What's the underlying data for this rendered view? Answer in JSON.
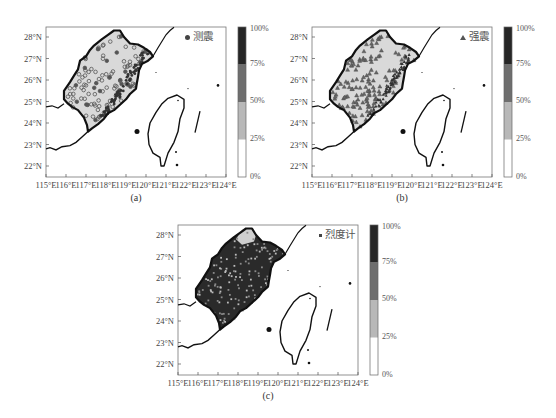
{
  "figure": {
    "caption_partial": "",
    "colorbar": {
      "ticks": [
        "0%",
        "25%",
        "50%",
        "75%",
        "100%"
      ],
      "bins": [
        {
          "range": "0%-25%",
          "color": "#ffffff"
        },
        {
          "range": "25%-50%",
          "color": "#b8b8b8"
        },
        {
          "range": "50%-75%",
          "color": "#6e6e6e"
        },
        {
          "range": "75%-100%",
          "color": "#262626"
        }
      ]
    },
    "x_ticks": [
      "115°E",
      "116°E",
      "117°E",
      "118°E",
      "119°E",
      "120°E",
      "121°E",
      "122°E",
      "123°E",
      "124°E"
    ],
    "y_ticks": [
      "22°N",
      "23°N",
      "24°N",
      "25°N",
      "26°N",
      "27°N",
      "28°N"
    ],
    "panels": [
      {
        "id": "a",
        "label": "(a)",
        "legend_marker": "circle",
        "legend_text": "测震",
        "fill": "#d9d9d9"
      },
      {
        "id": "b",
        "label": "(b)",
        "legend_marker": "triangle",
        "legend_text": "强震",
        "fill": "#d9d9d9"
      },
      {
        "id": "c",
        "label": "(c)",
        "legend_marker": "square",
        "legend_text": "烈度计",
        "fill": "#3a3a3a"
      }
    ]
  },
  "chart_data": [
    {
      "type": "map",
      "title": "(a)",
      "legend": [
        "测震"
      ],
      "marker": "circle",
      "xlabel": "",
      "ylabel": "",
      "xlim": [
        115,
        124
      ],
      "ylim": [
        21.6,
        28.5
      ],
      "x_ticks": [
        "115°E",
        "116°E",
        "117°E",
        "118°E",
        "119°E",
        "120°E",
        "121°E",
        "122°E",
        "123°E",
        "124°E"
      ],
      "y_ticks": [
        "22°N",
        "23°N",
        "24°N",
        "25°N",
        "26°N",
        "27°N",
        "28°N"
      ],
      "region_fill_bin": "0%-25%",
      "colorbar": {
        "ticks": [
          "0%",
          "25%",
          "50%",
          "75%",
          "100%"
        ]
      }
    },
    {
      "type": "map",
      "title": "(b)",
      "legend": [
        "强震"
      ],
      "marker": "triangle",
      "xlim": [
        115,
        124
      ],
      "ylim": [
        21.6,
        28.5
      ],
      "x_ticks": [
        "115°E",
        "116°E",
        "117°E",
        "118°E",
        "119°E",
        "120°E",
        "121°E",
        "122°E",
        "123°E",
        "124°E"
      ],
      "y_ticks": [
        "22°N",
        "23°N",
        "24°N",
        "25°N",
        "26°N",
        "27°N",
        "28°N"
      ],
      "region_fill_bin": "0%-25%",
      "colorbar": {
        "ticks": [
          "0%",
          "25%",
          "50%",
          "75%",
          "100%"
        ]
      }
    },
    {
      "type": "map",
      "title": "(c)",
      "legend": [
        "烈度计"
      ],
      "marker": "square",
      "xlim": [
        115,
        124
      ],
      "ylim": [
        21.6,
        28.5
      ],
      "x_ticks": [
        "115°E",
        "116°E",
        "117°E",
        "118°E",
        "119°E",
        "120°E",
        "121°E",
        "122°E",
        "123°E",
        "124°E"
      ],
      "y_ticks": [
        "22°N",
        "23°N",
        "24°N",
        "25°N",
        "26°N",
        "27°N",
        "28°N"
      ],
      "region_fill_bin": "75%-100% (mostly), small northern area 0%-25%",
      "colorbar": {
        "ticks": [
          "0%",
          "25%",
          "50%",
          "75%",
          "100%"
        ]
      }
    }
  ]
}
